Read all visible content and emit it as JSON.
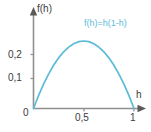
{
  "chart_data": {
    "type": "line",
    "title": "",
    "subtitle": "",
    "xlabel": "h",
    "ylabel": "f(h)",
    "annotations": [
      {
        "text": "f(h)=h(1-h)",
        "x": 0.62,
        "y": 0.3
      }
    ],
    "legend": [],
    "legend_position": "none",
    "grid": false,
    "xlim": [
      0,
      1.06
    ],
    "ylim": [
      0,
      0.283
    ],
    "xticks": [
      0,
      0.5,
      1
    ],
    "xtick_labels": [
      "0",
      "0,5",
      "1"
    ],
    "yticks": [
      0,
      0.1,
      0.2
    ],
    "ytick_labels": [
      "0",
      "0,1",
      "0,2"
    ],
    "series": [
      {
        "name": "f(h)=h(1-h)",
        "color": "#5bbcd8",
        "x": [
          0.0,
          0.05,
          0.1,
          0.15,
          0.2,
          0.25,
          0.3,
          0.35,
          0.4,
          0.45,
          0.5,
          0.55,
          0.6,
          0.65,
          0.7,
          0.75,
          0.8,
          0.85,
          0.9,
          0.95,
          1.0
        ],
        "y": [
          0.0,
          0.0475,
          0.09,
          0.1275,
          0.16,
          0.1875,
          0.21,
          0.2275,
          0.24,
          0.2475,
          0.25,
          0.2475,
          0.24,
          0.2275,
          0.21,
          0.1875,
          0.16,
          0.1275,
          0.09,
          0.0475,
          0.0
        ]
      }
    ],
    "maximum": {
      "x": 0.5,
      "y": 0.25
    },
    "roots": [
      0,
      1
    ]
  },
  "axes": {
    "y_title": "f(h)",
    "x_title": "h",
    "origin_label": "0",
    "y_tick_02": "0,2",
    "y_tick_01": "0,1",
    "x_tick_05": "0,5",
    "x_tick_1": "1"
  },
  "annotation": {
    "formula": "f(h)=h(1-h)"
  },
  "colors": {
    "curve": "#5bbcd8",
    "axis": "#8f8f8f",
    "text": "#3b3b3b",
    "background": "#ffffff"
  }
}
